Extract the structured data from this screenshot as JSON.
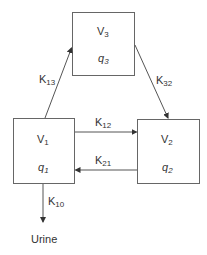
{
  "compartments": {
    "v3": {
      "volume": "V",
      "volume_sub": "3",
      "amount": "q",
      "amount_sub": "3"
    },
    "v1": {
      "volume": "V",
      "volume_sub": "1",
      "amount": "q",
      "amount_sub": "1"
    },
    "v2": {
      "volume": "V",
      "volume_sub": "2",
      "amount": "q",
      "amount_sub": "2"
    }
  },
  "rates": {
    "k13": {
      "main": "K",
      "sub": "13"
    },
    "k32": {
      "main": "K",
      "sub": "32"
    },
    "k12": {
      "main": "K",
      "sub": "12"
    },
    "k21": {
      "main": "K",
      "sub": "21"
    },
    "k10": {
      "main": "K",
      "sub": "10"
    }
  },
  "output_label": "Urine",
  "colors": {
    "line": "#555555",
    "text": "#333333"
  }
}
